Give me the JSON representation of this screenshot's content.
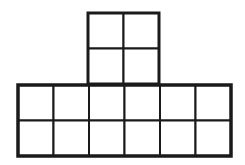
{
  "diagram": {
    "colors": {
      "background": "#ffffff",
      "line": "#1a1a1a"
    },
    "cell_size": 35.5,
    "upper_block": {
      "rows": 2,
      "cols": 2,
      "x": 88,
      "y": 13,
      "outer_stroke": 3,
      "inner_stroke": 2
    },
    "lower_block": {
      "rows": 2,
      "cols": 6,
      "x": 18,
      "y": 85,
      "outer_stroke": 3.5,
      "inner_stroke": 2
    },
    "total_squares": 16
  }
}
